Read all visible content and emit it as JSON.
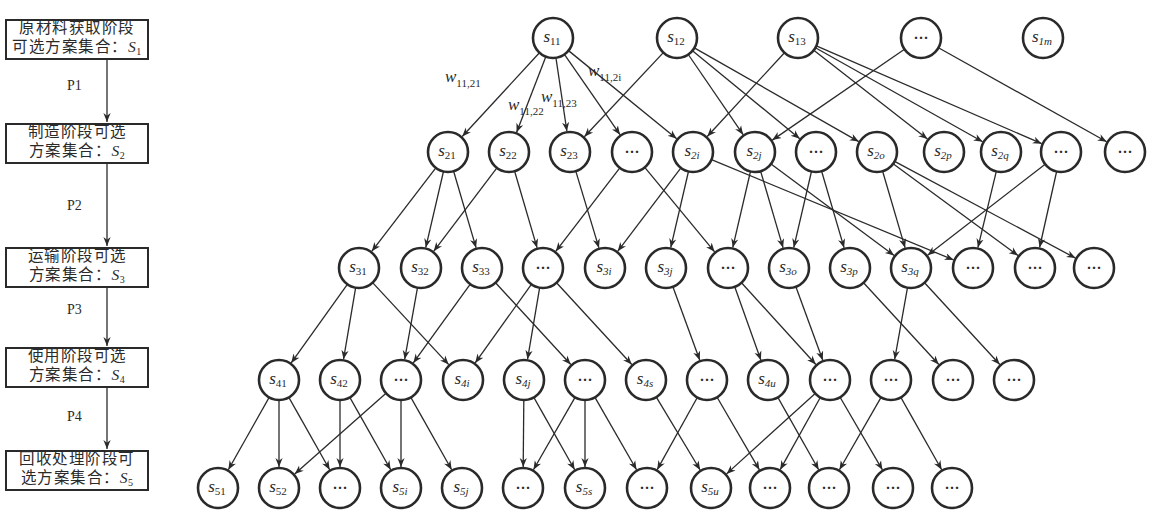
{
  "stages": [
    {
      "id": "S1",
      "line1": "原材料获取阶段",
      "line2": "可选方案集合：",
      "set_symbol": "S",
      "set_sub": "1",
      "top": 19
    },
    {
      "id": "S2",
      "line1": "制造阶段可选",
      "line2": "方案集合：",
      "set_symbol": "S",
      "set_sub": "2",
      "top": 123
    },
    {
      "id": "S3",
      "line1": "运输阶段可选",
      "line2": "方案集合：",
      "set_symbol": "S",
      "set_sub": "3",
      "top": 247
    },
    {
      "id": "S4",
      "line1": "使用阶段可选",
      "line2": "方案集合：",
      "set_symbol": "S",
      "set_sub": "4",
      "top": 347
    },
    {
      "id": "S5",
      "line1": "回收处理阶段可",
      "line2": "选方案集合：",
      "set_symbol": "S",
      "set_sub": "5",
      "top": 450
    }
  ],
  "transitions": [
    {
      "label": "P1",
      "y1": 60,
      "y2": 123,
      "label_y": 87
    },
    {
      "label": "P2",
      "y1": 164,
      "y2": 247,
      "label_y": 207
    },
    {
      "label": "P3",
      "y1": 288,
      "y2": 347,
      "label_y": 311
    },
    {
      "label": "P4",
      "y1": 388,
      "y2": 450,
      "label_y": 418
    }
  ],
  "node_radius": 20,
  "layers": [
    {
      "y": 38,
      "nodes": [
        {
          "id": "s11",
          "base": "s",
          "sub": "11",
          "x": 553
        },
        {
          "id": "s12",
          "base": "s",
          "sub": "12",
          "x": 677
        },
        {
          "id": "s13",
          "base": "s",
          "sub": "13",
          "x": 798
        },
        {
          "id": "L1d1",
          "ellipsis": true,
          "x": 921
        },
        {
          "id": "s1m",
          "base": "s",
          "sub": "1m",
          "x": 1043
        }
      ]
    },
    {
      "y": 152,
      "nodes": [
        {
          "id": "s21",
          "base": "s",
          "sub": "21",
          "x": 448
        },
        {
          "id": "s22",
          "base": "s",
          "sub": "22",
          "x": 509
        },
        {
          "id": "s23",
          "base": "s",
          "sub": "23",
          "x": 570
        },
        {
          "id": "L2d1",
          "ellipsis": true,
          "x": 632
        },
        {
          "id": "s2i",
          "base": "s",
          "sub": "2i",
          "x": 693
        },
        {
          "id": "s2j",
          "base": "s",
          "sub": "2j",
          "x": 755
        },
        {
          "id": "L2d2",
          "ellipsis": true,
          "x": 816
        },
        {
          "id": "s2o",
          "base": "s",
          "sub": "2o",
          "x": 877
        },
        {
          "id": "s2p",
          "base": "s",
          "sub": "2p",
          "x": 944
        },
        {
          "id": "s2q",
          "base": "s",
          "sub": "2q",
          "x": 1001
        },
        {
          "id": "L2d3",
          "ellipsis": true,
          "x": 1061
        },
        {
          "id": "L2d4",
          "ellipsis": true,
          "x": 1125
        }
      ]
    },
    {
      "y": 268,
      "nodes": [
        {
          "id": "s31",
          "base": "s",
          "sub": "31",
          "x": 359
        },
        {
          "id": "s32",
          "base": "s",
          "sub": "32",
          "x": 421
        },
        {
          "id": "s33",
          "base": "s",
          "sub": "33",
          "x": 482
        },
        {
          "id": "L3d1",
          "ellipsis": true,
          "x": 543
        },
        {
          "id": "s3i",
          "base": "s",
          "sub": "3i",
          "x": 605
        },
        {
          "id": "s3j",
          "base": "s",
          "sub": "3j",
          "x": 666
        },
        {
          "id": "L3d2",
          "ellipsis": true,
          "x": 728
        },
        {
          "id": "s3o",
          "base": "s",
          "sub": "3o",
          "x": 789
        },
        {
          "id": "s3p",
          "base": "s",
          "sub": "3p",
          "x": 850
        },
        {
          "id": "s3q",
          "base": "s",
          "sub": "3q",
          "x": 911
        },
        {
          "id": "L3d3",
          "ellipsis": true,
          "x": 973
        },
        {
          "id": "L3d4",
          "ellipsis": true,
          "x": 1035
        },
        {
          "id": "L3d5",
          "ellipsis": true,
          "x": 1094
        }
      ]
    },
    {
      "y": 380,
      "nodes": [
        {
          "id": "s41",
          "base": "s",
          "sub": "41",
          "x": 279
        },
        {
          "id": "s42",
          "base": "s",
          "sub": "42",
          "x": 340
        },
        {
          "id": "L4d1",
          "ellipsis": true,
          "x": 401
        },
        {
          "id": "s4i",
          "base": "s",
          "sub": "4i",
          "x": 463
        },
        {
          "id": "s4j",
          "base": "s",
          "sub": "4j",
          "x": 524
        },
        {
          "id": "L4d2",
          "ellipsis": true,
          "x": 585
        },
        {
          "id": "s4s",
          "base": "s",
          "sub": "4s",
          "x": 646
        },
        {
          "id": "L4d3",
          "ellipsis": true,
          "x": 707
        },
        {
          "id": "s4u",
          "base": "s",
          "sub": "4u",
          "x": 768
        },
        {
          "id": "L4d4",
          "ellipsis": true,
          "x": 830
        },
        {
          "id": "L4d5",
          "ellipsis": true,
          "x": 891
        },
        {
          "id": "L4d6",
          "ellipsis": true,
          "x": 953
        },
        {
          "id": "L4d7",
          "ellipsis": true,
          "x": 1014
        }
      ]
    },
    {
      "y": 488,
      "nodes": [
        {
          "id": "s51",
          "base": "s",
          "sub": "51",
          "x": 218
        },
        {
          "id": "s52",
          "base": "s",
          "sub": "52",
          "x": 279
        },
        {
          "id": "L5d1",
          "ellipsis": true,
          "x": 340
        },
        {
          "id": "s5i",
          "base": "s",
          "sub": "5i",
          "x": 401
        },
        {
          "id": "s5j",
          "base": "s",
          "sub": "5j",
          "x": 462
        },
        {
          "id": "L5d2",
          "ellipsis": true,
          "x": 523
        },
        {
          "id": "s5s",
          "base": "s",
          "sub": "5s",
          "x": 585
        },
        {
          "id": "L5d3",
          "ellipsis": true,
          "x": 647
        },
        {
          "id": "s5u",
          "base": "s",
          "sub": "5u",
          "x": 711
        },
        {
          "id": "L5d4",
          "ellipsis": true,
          "x": 770
        },
        {
          "id": "L5d5",
          "ellipsis": true,
          "x": 829
        },
        {
          "id": "L5d6",
          "ellipsis": true,
          "x": 893
        },
        {
          "id": "L5d7",
          "ellipsis": true,
          "x": 952
        }
      ]
    }
  ],
  "edges": [
    [
      "s11",
      "s21"
    ],
    [
      "s11",
      "s22"
    ],
    [
      "s11",
      "s23"
    ],
    [
      "s11",
      "L2d1"
    ],
    [
      "s11",
      "s2i"
    ],
    [
      "s12",
      "s23"
    ],
    [
      "s12",
      "s2j"
    ],
    [
      "s12",
      "L2d2"
    ],
    [
      "s12",
      "s2o"
    ],
    [
      "s13",
      "s2i"
    ],
    [
      "s13",
      "s2p"
    ],
    [
      "s13",
      "s2q"
    ],
    [
      "s13",
      "L2d3"
    ],
    [
      "L1d1",
      "s2j"
    ],
    [
      "L1d1",
      "L2d4"
    ],
    [
      "s21",
      "s31"
    ],
    [
      "s21",
      "s32"
    ],
    [
      "s21",
      "s33"
    ],
    [
      "s22",
      "s32"
    ],
    [
      "s22",
      "L3d1"
    ],
    [
      "s23",
      "s3i"
    ],
    [
      "L2d1",
      "L3d1"
    ],
    [
      "L2d1",
      "L3d2"
    ],
    [
      "s2i",
      "s3i"
    ],
    [
      "s2i",
      "s3j"
    ],
    [
      "s2i",
      "L3d3"
    ],
    [
      "s2j",
      "L3d2"
    ],
    [
      "s2j",
      "s3o"
    ],
    [
      "s2j",
      "s3q"
    ],
    [
      "L2d2",
      "s3o"
    ],
    [
      "L2d2",
      "s3p"
    ],
    [
      "s2o",
      "s3q"
    ],
    [
      "s2o",
      "L3d4"
    ],
    [
      "s2o",
      "L3d5"
    ],
    [
      "s2q",
      "L3d3"
    ],
    [
      "L2d3",
      "s3q"
    ],
    [
      "L2d3",
      "L3d4"
    ],
    [
      "s31",
      "s41"
    ],
    [
      "s31",
      "s42"
    ],
    [
      "s31",
      "s4i"
    ],
    [
      "s32",
      "L4d1"
    ],
    [
      "s33",
      "L4d1"
    ],
    [
      "s33",
      "L4d2"
    ],
    [
      "L3d1",
      "s4i"
    ],
    [
      "L3d1",
      "s4j"
    ],
    [
      "L3d1",
      "s4s"
    ],
    [
      "s3j",
      "L4d3"
    ],
    [
      "L3d2",
      "s4u"
    ],
    [
      "L3d2",
      "L4d4"
    ],
    [
      "s3o",
      "L4d4"
    ],
    [
      "s3p",
      "L4d6"
    ],
    [
      "s3q",
      "L4d5"
    ],
    [
      "s3q",
      "L4d7"
    ],
    [
      "s41",
      "s51"
    ],
    [
      "s41",
      "s52"
    ],
    [
      "s41",
      "L5d1"
    ],
    [
      "s42",
      "L5d1"
    ],
    [
      "s42",
      "s5i"
    ],
    [
      "L4d1",
      "s52"
    ],
    [
      "L4d1",
      "s5i"
    ],
    [
      "L4d1",
      "s5j"
    ],
    [
      "s4j",
      "L5d2"
    ],
    [
      "s4j",
      "s5s"
    ],
    [
      "L4d2",
      "L5d2"
    ],
    [
      "L4d2",
      "s5s"
    ],
    [
      "L4d2",
      "L5d3"
    ],
    [
      "s4s",
      "s5u"
    ],
    [
      "L4d3",
      "L5d3"
    ],
    [
      "L4d3",
      "L5d4"
    ],
    [
      "s4u",
      "L5d5"
    ],
    [
      "L4d4",
      "s5u"
    ],
    [
      "L4d4",
      "L5d4"
    ],
    [
      "L4d4",
      "L5d6"
    ],
    [
      "L4d5",
      "L5d5"
    ],
    [
      "L4d5",
      "L5d7"
    ]
  ],
  "weight_labels": [
    {
      "base": "w",
      "sub": "11,21",
      "x": 445,
      "y": 82,
      "edge": [
        "s11",
        "s21"
      ]
    },
    {
      "base": "w",
      "sub": "11,22",
      "x": 508,
      "y": 110,
      "edge": [
        "s11",
        "s22"
      ]
    },
    {
      "base": "w",
      "sub": "11,23",
      "x": 541,
      "y": 102,
      "edge": [
        "s11",
        "s23"
      ]
    },
    {
      "base": "w",
      "sub": "11,2i",
      "x": 588,
      "y": 76,
      "edge": [
        "s11",
        "s2i"
      ]
    }
  ],
  "ellipsis_text": "···",
  "colors": {
    "stroke": "#2a2a2a",
    "node_fill": "#ffffff",
    "background": "#ffffff"
  }
}
